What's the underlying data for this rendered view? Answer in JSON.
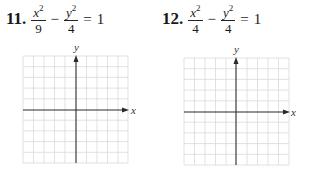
{
  "problems": [
    {
      "number": "11.",
      "equation": {
        "term1_num": "x",
        "term1_exp": "2",
        "term1_den": "9",
        "operator": "−",
        "term2_num": "y",
        "term2_exp": "2",
        "term2_den": "4",
        "equals": "=",
        "rhs": "1"
      },
      "graph": {
        "x_label": "x",
        "y_label": "y",
        "grid_cells": 10
      }
    },
    {
      "number": "12.",
      "equation": {
        "term1_num": "x",
        "term1_exp": "2",
        "term1_den": "4",
        "operator": "−",
        "term2_num": "y",
        "term2_exp": "2",
        "term2_den": "4",
        "equals": "=",
        "rhs": "1"
      },
      "graph": {
        "x_label": "x",
        "y_label": "y",
        "grid_cells": 10
      }
    }
  ],
  "colors": {
    "grid_line": "#d9d9d9",
    "axis": "#2a2a2a",
    "text": "#1a1a1a"
  }
}
